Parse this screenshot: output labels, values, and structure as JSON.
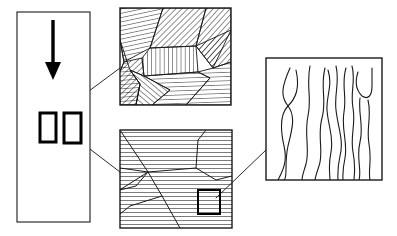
{
  "figure": {
    "background": "#ffffff",
    "width": 397,
    "height": 236,
    "stroke_color": "#1a1a1a",
    "hatch_color": "#222222",
    "roi_color": "#000000",
    "leader_color": "#2b2b2b"
  },
  "panels": {
    "specimen": {
      "name": "specimen-panel",
      "label": "Specimen bar",
      "x": 17,
      "y": 12,
      "width": 73,
      "height": 210,
      "border_width": 1.1,
      "arrow": {
        "name": "load-direction-arrow",
        "label": "Loading direction",
        "direction": "down",
        "x": 53,
        "y_start": 20,
        "y_end": 80,
        "shaft_width": 3.4,
        "head_width": 16,
        "head_length": 18
      },
      "regions_of_interest": [
        {
          "name": "roi-left",
          "label": "Region of interest 1",
          "x": 40,
          "y": 113,
          "width": 16,
          "height": 29,
          "border_width": 3
        },
        {
          "name": "roi-right",
          "label": "Region of interest 2",
          "x": 64,
          "y": 113,
          "width": 17,
          "height": 30,
          "border_width": 3
        }
      ]
    },
    "grains_upper": {
      "name": "grain-structure-upper-panel",
      "label": "Polycrystalline grain structure (varied orientations)",
      "x": 120,
      "y": 8,
      "width": 111,
      "height": 97,
      "border_width": 1.4,
      "hatch_spacing": 4.2,
      "hatch_width": 1.0,
      "grains": [
        {
          "name": "grain-1",
          "angle": 78,
          "points": "120,8 163,8 150,48 124,62 120,40"
        },
        {
          "name": "grain-2",
          "angle": 45,
          "points": "163,8 206,8 196,46 150,48"
        },
        {
          "name": "grain-3",
          "angle": 42,
          "points": "206,8 231,8 231,30 213,68 196,46"
        },
        {
          "name": "grain-4",
          "angle": 0,
          "points": "150,48 196,46 198,72 144,76 142,58"
        },
        {
          "name": "grain-5",
          "angle": 86,
          "points": "120,40 124,62 118,76 120,105 136,105 140,84 130,70"
        },
        {
          "name": "grain-6",
          "angle": 46,
          "points": "124,62 142,58 144,76 130,70 140,84 136,105 120,105 118,76"
        },
        {
          "name": "grain-7",
          "angle": 130,
          "points": "130,70 144,76 170,90 152,105 136,105 140,84"
        },
        {
          "name": "grain-8",
          "angle": 88,
          "points": "144,76 198,72 210,78 186,105 152,105 170,90"
        },
        {
          "name": "grain-9",
          "angle": 88,
          "points": "198,72 213,68 231,62 231,105 186,105 210,78"
        },
        {
          "name": "grain-10",
          "angle": 42,
          "points": "196,46 213,68 231,62 231,30"
        }
      ]
    },
    "grains_lower": {
      "name": "grain-structure-lower-panel",
      "label": "Magnified grain structure (single orientation)",
      "x": 120,
      "y": 130,
      "width": 112,
      "height": 98,
      "border_width": 1.4,
      "hatch_spacing": 4.0,
      "hatch_width": 1.2,
      "hatch_angle": 90,
      "grain_boundaries": [
        {
          "name": "boundary-1",
          "points": "120,130 148,172 104,200"
        },
        {
          "name": "boundary-2",
          "points": "148,172 196,168 216,180 232,176"
        },
        {
          "name": "boundary-3",
          "points": "148,172 162,196 180,228"
        },
        {
          "name": "boundary-4",
          "points": "120,168 148,172"
        },
        {
          "name": "boundary-5",
          "points": "196,168 198,140 206,130"
        },
        {
          "name": "boundary-6",
          "points": "148,172 136,186 120,190"
        },
        {
          "name": "boundary-7",
          "points": "162,196 130,206 120,214"
        }
      ],
      "region_of_interest": {
        "name": "roi-lower-panel",
        "label": "Region of interest 3",
        "x": 198,
        "y": 190,
        "width": 22,
        "height": 24,
        "border_width": 2
      }
    },
    "dislocations": {
      "name": "dislocation-panel",
      "label": "Dislocation lines",
      "x": 266,
      "y": 58,
      "width": 116,
      "height": 122,
      "border_width": 1.4,
      "line_width": 1.1,
      "lines": [
        {
          "name": "dislocation-line-1",
          "path": "M 290,68 C 282,86 280,96 288,106 C 296,116 292,130 288,146 C 284,164 288,178 284,180"
        },
        {
          "name": "dislocation-line-2",
          "path": "M 296,70 C 300,88 296,98 288,106 C 280,114 280,128 284,146 C 288,162 282,172 278,180"
        },
        {
          "name": "dislocation-line-3",
          "path": "M 310,66 C 306,86 312,98 308,116 C 304,134 310,150 306,164 C 303,174 302,176 302,180"
        },
        {
          "name": "dislocation-line-4",
          "path": "M 325,68 C 320,88 327,100 322,118 C 317,136 324,152 319,166 C 316,175 315,178 315,180"
        },
        {
          "name": "dislocation-line-5",
          "path": "M 328,70 C 333,86 326,96 327,110 C 328,126 334,136 331,152 C 328,166 330,174 330,180"
        },
        {
          "name": "dislocation-line-6",
          "path": "M 336,66 C 340,82 334,94 336,110 C 338,128 344,140 340,156 C 337,170 338,176 338,180"
        },
        {
          "name": "dislocation-line-7",
          "path": "M 346,68 C 341,84 347,96 344,112 C 341,130 348,142 345,158 C 342,172 343,177 343,180"
        },
        {
          "name": "dislocation-line-8",
          "path": "M 352,66 C 356,80 350,92 353,108 C 356,124 350,136 353,152 C 356,168 354,176 354,180"
        },
        {
          "name": "dislocation-line-9",
          "path": "M 358,72 C 354,84 358,92 362,96 C 368,100 372,96 372,86 C 372,78 372,72 372,68"
        },
        {
          "name": "dislocation-line-10",
          "path": "M 360,98 C 358,114 364,126 360,142 C 356,158 362,170 359,180"
        },
        {
          "name": "dislocation-line-11",
          "path": "M 368,100 C 372,116 366,128 369,144 C 372,160 368,172 370,180"
        }
      ]
    }
  },
  "leaders": [
    {
      "name": "leader-roi-left-to-upper-panel",
      "label": "Magnification leader to upper grain panel",
      "from_x": 58,
      "from_y": 114,
      "to_x": 120,
      "to_y": 68,
      "width": 1.0
    },
    {
      "name": "leader-roi-right-to-lower-panel",
      "label": "Magnification leader to lower grain panel",
      "from_x": 82,
      "from_y": 143,
      "to_x": 120,
      "to_y": 172,
      "width": 1.0
    },
    {
      "name": "leader-lower-roi-to-dislocation-panel",
      "label": "Magnification leader to dislocation panel",
      "from_x": 216,
      "from_y": 198,
      "to_x": 266,
      "to_y": 150,
      "width": 1.0
    }
  ]
}
